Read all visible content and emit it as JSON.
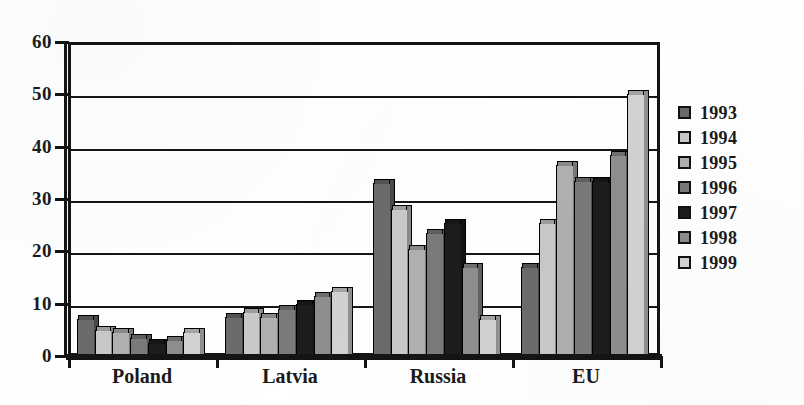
{
  "chart_data": {
    "type": "bar",
    "title": "",
    "xlabel": "",
    "ylabel": "",
    "categories": [
      "Poland",
      "Latvia",
      "Russia",
      "EU"
    ],
    "ylim": [
      0,
      60
    ],
    "yticks": [
      0,
      10,
      20,
      30,
      40,
      50,
      60
    ],
    "ytick_labels": [
      "0",
      "10",
      "20",
      "30",
      "40",
      "50",
      "60"
    ],
    "grid": true,
    "legend_position": "right",
    "series": [
      {
        "name": "1993",
        "color": "#6b6b6b",
        "values": [
          7.0,
          7.5,
          33.0,
          17.0
        ]
      },
      {
        "name": "1994",
        "color": "#c9c9c9",
        "values": [
          5.0,
          8.5,
          28.0,
          25.5
        ]
      },
      {
        "name": "1995",
        "color": "#b0b0b0",
        "values": [
          4.5,
          7.5,
          20.5,
          36.5
        ]
      },
      {
        "name": "1996",
        "color": "#7a7a7a",
        "values": [
          3.5,
          9.0,
          23.5,
          33.5
        ]
      },
      {
        "name": "1997",
        "color": "#1c1c1c",
        "values": [
          2.5,
          10.0,
          25.5,
          33.5
        ]
      },
      {
        "name": "1998",
        "color": "#8e8e8e",
        "values": [
          3.0,
          11.5,
          17.0,
          38.5
        ]
      },
      {
        "name": "1999",
        "color": "#d2d2d2",
        "values": [
          4.5,
          12.5,
          7.0,
          50.0
        ]
      }
    ]
  },
  "legend": {
    "items": [
      {
        "label": "1993"
      },
      {
        "label": "1994"
      },
      {
        "label": "1995"
      },
      {
        "label": "1996"
      },
      {
        "label": "1997"
      },
      {
        "label": "1998"
      },
      {
        "label": "1999"
      }
    ]
  },
  "axes": {
    "y_labels": [
      "60",
      "50",
      "40",
      "30",
      "20",
      "10",
      "0"
    ],
    "x_labels": [
      "Poland",
      "Latvia",
      "Russia",
      "EU"
    ]
  },
  "colors": {
    "axis": "#141414",
    "grid": "#161616",
    "background": "#ffffff"
  }
}
